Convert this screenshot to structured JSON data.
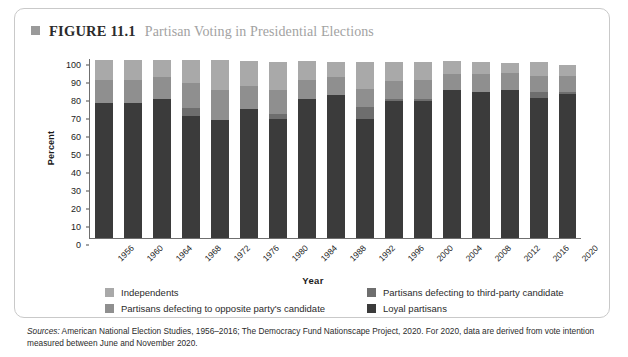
{
  "figure": {
    "marker_icon": "square-bullet-icon",
    "number": "FIGURE 11.1",
    "title": "Partisan Voting in Presidential Elections"
  },
  "axis": {
    "y_title": "Percent",
    "x_title": "Year"
  },
  "legend": {
    "items": [
      {
        "label": "Independents",
        "color": "#a9a9a9",
        "key": "independents"
      },
      {
        "label": "Partisans defecting to opposite party's candidate",
        "color": "#8f8f8f",
        "key": "defect_opposite"
      },
      {
        "label": "Partisans defecting to third-party candidate",
        "color": "#6e6e6e",
        "key": "defect_third"
      },
      {
        "label": "Loyal partisans",
        "color": "#3b3b3b",
        "key": "loyal"
      }
    ]
  },
  "source": {
    "prefix": "Sources:",
    "text": " American National Election Studies, 1956–2016; The Democracy Fund Nationscape Project, 2020. For 2020, data are derived from vote intention measured between June and November 2020."
  },
  "chart_data": {
    "type": "bar",
    "stacked": true,
    "title": "Partisan Voting in Presidential Elections",
    "xlabel": "Year",
    "ylabel": "Percent",
    "ylim": [
      0,
      100
    ],
    "yticks": [
      0,
      10,
      20,
      30,
      40,
      50,
      60,
      70,
      80,
      90,
      100
    ],
    "grid": false,
    "legend_position": "bottom",
    "categories": [
      "1956",
      "1960",
      "1964",
      "1968",
      "1972",
      "1976",
      "1980",
      "1984",
      "1988",
      "1992",
      "1996",
      "2000",
      "2004",
      "2008",
      "2012",
      "2016",
      "2020"
    ],
    "series": [
      {
        "name": "Loyal partisans",
        "color": "#3b3b3b",
        "values": [
          75,
          75,
          77.5,
          68,
          65.5,
          71.5,
          66,
          77,
          79.5,
          66,
          76,
          76,
          82,
          81,
          82.5,
          78,
          80
        ]
      },
      {
        "name": "Partisans defecting to third-party candidate",
        "color": "#6e6e6e",
        "values": [
          0,
          0,
          0,
          4,
          0,
          0,
          3,
          0,
          0,
          7,
          1,
          1,
          0,
          0,
          0,
          3,
          1
        ]
      },
      {
        "name": "Partisans defecting to opposite party's candidate",
        "color": "#8f8f8f",
        "values": [
          13,
          13,
          12,
          14,
          17,
          13,
          13,
          11,
          10,
          10,
          10,
          11,
          9,
          10,
          9,
          9,
          9
        ]
      },
      {
        "name": "Independents",
        "color": "#a9a9a9",
        "values": [
          11,
          11,
          9.5,
          13,
          16.5,
          14,
          16,
          10.5,
          8.5,
          15,
          11,
          10,
          7.5,
          7,
          6,
          8,
          6
        ]
      }
    ],
    "totals": [
      99,
      99,
      99,
      99,
      99,
      98.5,
      98,
      98.5,
      98,
      98,
      98,
      98,
      98.5,
      98,
      97.5,
      98,
      96
    ]
  }
}
